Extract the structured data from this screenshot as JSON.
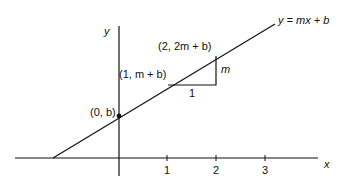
{
  "diagram": {
    "type": "coordinate-plane-line",
    "equation_label": "y = mx + b",
    "axes": {
      "x_label": "x",
      "y_label": "y",
      "x_ticks": [
        "1",
        "2",
        "3"
      ]
    },
    "points": [
      {
        "label": "(0, b)",
        "marked": true
      },
      {
        "label": "(1, m + b)",
        "marked": false
      },
      {
        "label": "(2, 2m + b)",
        "marked": false
      }
    ],
    "slope_triangle": {
      "run_label": "1",
      "rise_label": "m"
    },
    "colors": {
      "stroke": "#111111",
      "background": "#ffffff"
    }
  }
}
